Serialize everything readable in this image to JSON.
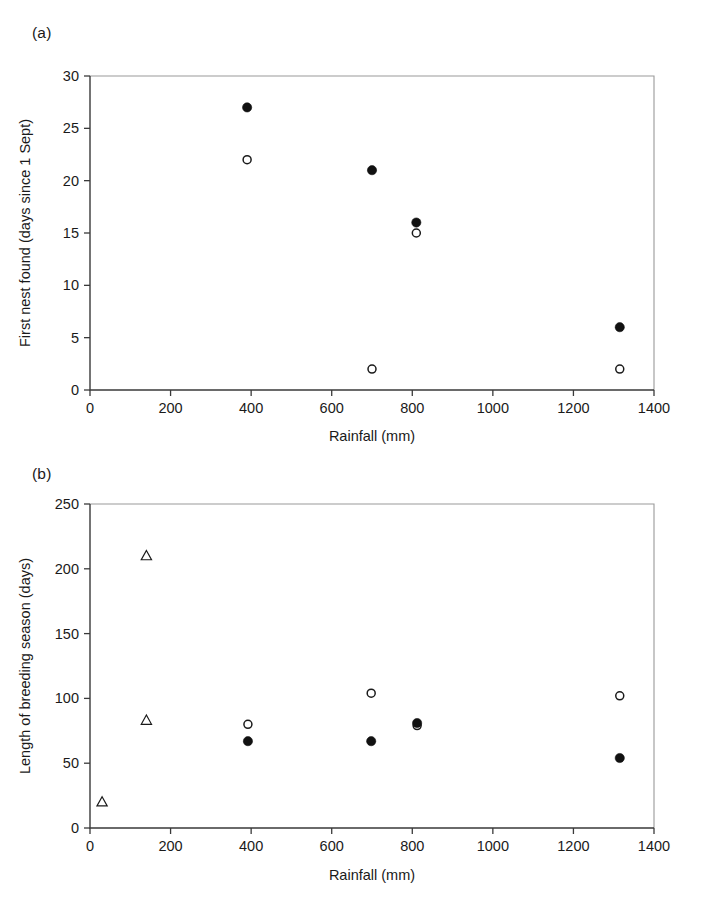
{
  "figure": {
    "panel_a_label": "(a)",
    "panel_b_label": "(b)"
  },
  "chart_data": [
    {
      "panel": "(a)",
      "type": "scatter",
      "title": "",
      "xlabel": "Rainfall (mm)",
      "ylabel": "First nest found (days since 1 Sept)",
      "xlim": [
        0,
        1400
      ],
      "ylim": [
        0,
        30
      ],
      "xticks": [
        0,
        200,
        400,
        600,
        800,
        1000,
        1200,
        1400
      ],
      "yticks": [
        0,
        5,
        10,
        15,
        20,
        25,
        30
      ],
      "xticklabels": [
        "0",
        "200",
        "400",
        "600",
        "800",
        "1000",
        "1200",
        "1400"
      ],
      "yticklabels": [
        "0",
        "5",
        "10",
        "15",
        "20",
        "25",
        "30"
      ],
      "grid": false,
      "legend": "none",
      "series": [
        {
          "name": "filled-circle",
          "marker": "filled-circle",
          "points": [
            {
              "x": 390,
              "y": 27
            },
            {
              "x": 700,
              "y": 21
            },
            {
              "x": 810,
              "y": 16
            },
            {
              "x": 1315,
              "y": 6
            }
          ]
        },
        {
          "name": "open-circle",
          "marker": "open-circle",
          "points": [
            {
              "x": 390,
              "y": 22
            },
            {
              "x": 700,
              "y": 2
            },
            {
              "x": 810,
              "y": 15
            },
            {
              "x": 1315,
              "y": 2
            }
          ]
        }
      ]
    },
    {
      "panel": "(b)",
      "type": "scatter",
      "title": "",
      "xlabel": "Rainfall (mm)",
      "ylabel": "Length of breeding season (days)",
      "xlim": [
        0,
        1400
      ],
      "ylim": [
        0,
        250
      ],
      "xticks": [
        0,
        200,
        400,
        600,
        800,
        1000,
        1200,
        1400
      ],
      "yticks": [
        0,
        50,
        100,
        150,
        200,
        250
      ],
      "xticklabels": [
        "0",
        "200",
        "400",
        "600",
        "800",
        "1000",
        "1200",
        "1400"
      ],
      "yticklabels": [
        "0",
        "50",
        "100",
        "150",
        "200",
        "250"
      ],
      "grid": false,
      "legend": "none",
      "series": [
        {
          "name": "open-triangle",
          "marker": "open-triangle",
          "points": [
            {
              "x": 30,
              "y": 20
            },
            {
              "x": 140,
              "y": 210
            },
            {
              "x": 140,
              "y": 83
            }
          ]
        },
        {
          "name": "open-circle",
          "marker": "open-circle",
          "points": [
            {
              "x": 392,
              "y": 80
            },
            {
              "x": 698,
              "y": 104
            },
            {
              "x": 812,
              "y": 79
            },
            {
              "x": 1315,
              "y": 102
            }
          ]
        },
        {
          "name": "filled-circle",
          "marker": "filled-circle",
          "points": [
            {
              "x": 392,
              "y": 67
            },
            {
              "x": 698,
              "y": 67
            },
            {
              "x": 812,
              "y": 81
            },
            {
              "x": 1315,
              "y": 54
            }
          ]
        }
      ]
    }
  ]
}
